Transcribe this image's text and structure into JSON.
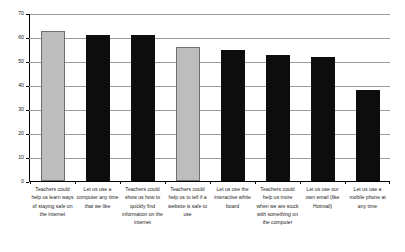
{
  "chart_data": {
    "type": "bar",
    "title": "",
    "subtitle": "",
    "xlabel": "",
    "ylabel": "",
    "ylim": [
      0,
      70
    ],
    "ytick_step": 10,
    "ytick_labels": [
      "70",
      "60",
      "50",
      "40",
      "30",
      "20",
      "10",
      "0"
    ],
    "grid": true,
    "legend": "none",
    "categories": [
      "Teachers could help us learn ways of staying safe on the internet",
      "Let us use a computer any time that we like",
      "Teachers could show us how to quickly find information on the internet",
      "Teachers could help us to tell if a website is safe to use",
      "Let us use the interactive white board",
      "Teachers could help us more when we are stuck with something on the computer",
      "Let us use our own email (like Hotmail)",
      "Let us use a mobile phone at any time"
    ],
    "values": [
      63,
      61,
      61,
      56,
      55,
      53,
      52,
      38
    ],
    "bar_colors": [
      "#bdbdbd",
      "#0d0d0d",
      "#0d0d0d",
      "#bdbdbd",
      "#0d0d0d",
      "#0d0d0d",
      "#0d0d0d",
      "#0d0d0d"
    ],
    "colors": {
      "light_bar": "#bdbdbd",
      "dark_bar": "#0d0d0d",
      "gridline": "#9a9a9a",
      "axis": "#000000",
      "text": "#1a1a1a",
      "background": "#ffffff"
    }
  }
}
